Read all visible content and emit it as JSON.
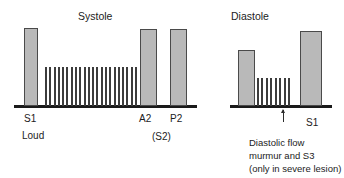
{
  "diagram": {
    "type": "phonocardiogram",
    "title_phases": {
      "systole": "Systole",
      "diastole": "Diastole"
    },
    "sound_labels": {
      "s1_first": "S1",
      "s1_first_qualifier": "Loud",
      "a2": "A2",
      "p2": "P2",
      "s2_group": "(S2)",
      "s1_last": "S1"
    },
    "annotation": {
      "line1": "Diastolic flow",
      "line2": "murmur and S3",
      "line3": "(only in severe lesion)"
    },
    "colors": {
      "bar_fill": "#b9b9b9",
      "bar_stroke": "#4a4a4a",
      "baseline": "#1a1a1a",
      "spike": "#3c3c3c",
      "text": "#1c1c1c",
      "background": "#ffffff"
    }
  },
  "chart_data": {
    "type": "bar",
    "xlabel": "",
    "ylabel": "Sound intensity",
    "grid": false,
    "legend": "none",
    "baseline_y_px": 106,
    "categories": [
      "S1",
      "Systolic murmur",
      "A2",
      "P2",
      "S2/A2 (next cycle)",
      "Diastolic flow murmur and S3",
      "S1"
    ],
    "values": [
      78,
      39,
      77,
      77,
      56,
      28,
      75
    ],
    "bars": [
      {
        "name": "S1",
        "label": "S1",
        "x": 24,
        "width": 14,
        "top": 28,
        "height": 78,
        "kind": "sound"
      },
      {
        "name": "A2",
        "label": "A2",
        "x": 140,
        "width": 17,
        "top": 29,
        "height": 77,
        "kind": "sound"
      },
      {
        "name": "P2",
        "label": "P2",
        "x": 170,
        "width": 17,
        "top": 29,
        "height": 77,
        "kind": "sound"
      },
      {
        "name": "S2-next",
        "label": "",
        "x": 238,
        "width": 17,
        "top": 50,
        "height": 56,
        "kind": "sound"
      },
      {
        "name": "S1-last",
        "label": "S1",
        "x": 300,
        "width": 22,
        "top": 31,
        "height": 75,
        "kind": "sound"
      }
    ],
    "murmurs": [
      {
        "name": "systolic-murmur",
        "x": 45,
        "width": 92,
        "top": 67,
        "height": 39,
        "spike_count": 22,
        "shape": "plateau/holosystolic"
      },
      {
        "name": "diastolic-flow-murmur",
        "x": 257,
        "width": 33,
        "top": 78,
        "height": 28,
        "spike_count": 8,
        "shape": "short decrescendo"
      }
    ],
    "annotations": [
      {
        "name": "arrow-to-s3",
        "x": 283,
        "y_top": 110,
        "y_bottom": 122,
        "points_to": "Diastolic flow murmur and S3"
      }
    ],
    "phase_spans": [
      {
        "name": "Systole",
        "from_sound": "S1",
        "to_sound": "A2"
      },
      {
        "name": "Diastole",
        "from_sound": "P2",
        "to_sound": "S1"
      }
    ]
  }
}
